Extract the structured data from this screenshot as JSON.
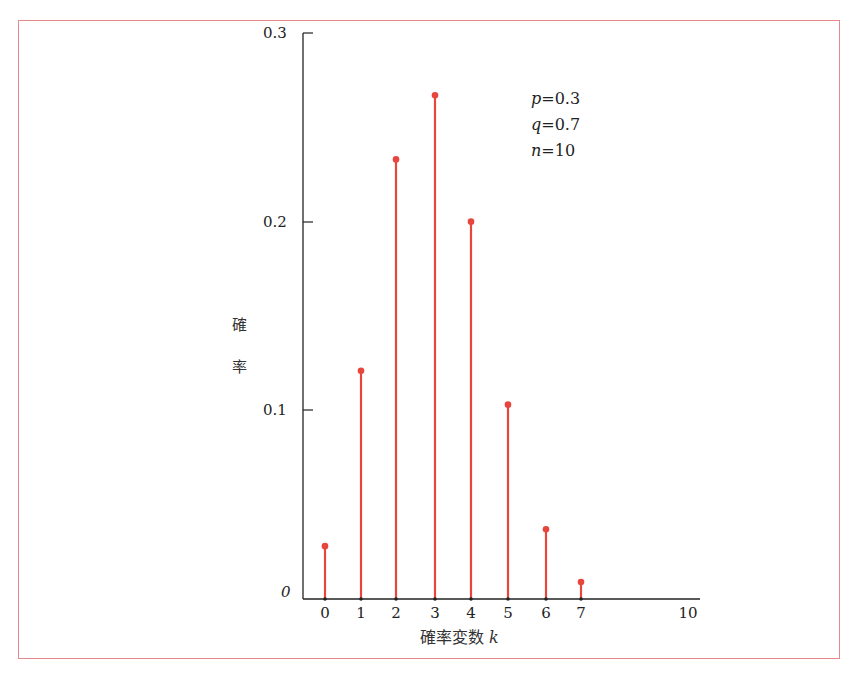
{
  "chart_data": {
    "type": "bar",
    "subtype": "stem",
    "title": "",
    "xlabel": "確率変数 k",
    "ylabel": "確率",
    "ylim": [
      0,
      0.3
    ],
    "xlim": [
      0,
      10
    ],
    "x_ticks": [
      "0",
      "1",
      "2",
      "3",
      "4",
      "5",
      "6",
      "7",
      "10"
    ],
    "y_ticks": [
      "0",
      "0.1",
      "0.2",
      "0.3"
    ],
    "grid": false,
    "categories": [
      0,
      1,
      2,
      3,
      4,
      5,
      6,
      7
    ],
    "values": [
      0.028,
      0.121,
      0.233,
      0.267,
      0.2,
      0.103,
      0.037,
      0.009
    ],
    "series_color": "#e8453c",
    "annotations": [
      "p=0.3",
      "q=0.7",
      "n=10"
    ]
  },
  "labels": {
    "y_tick_0": "0",
    "y_tick_1": "0.1",
    "y_tick_2": "0.2",
    "y_tick_3": "0.3",
    "ylabel_char1": "確",
    "ylabel_char2": "率",
    "xlabel_text": "確率変数 ",
    "xlabel_var": "k",
    "anno_p_var": "p",
    "anno_p_val": "=0.3",
    "anno_q_var": "q",
    "anno_q_val": "=0.7",
    "anno_n_var": "n",
    "anno_n_val": "=10",
    "x_ticks": [
      "0",
      "1",
      "2",
      "3",
      "4",
      "5",
      "6",
      "7",
      "10"
    ]
  },
  "colors": {
    "frame": "#e58a8a",
    "stem": "#e8453c",
    "axis": "#222222"
  }
}
